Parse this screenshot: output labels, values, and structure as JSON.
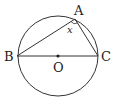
{
  "diagram": {
    "type": "geometry",
    "circle": {
      "center_label": "O"
    },
    "points": {
      "A": "A",
      "B": "B",
      "C": "C",
      "O": "O"
    },
    "angle_label": "x",
    "segments": [
      "AB",
      "AC",
      "BC"
    ],
    "colors": {
      "stroke": "#333333",
      "text": "#222222",
      "background": "#ffffff"
    }
  }
}
